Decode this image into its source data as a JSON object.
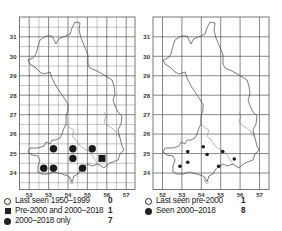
{
  "maps": [
    {
      "id": "left",
      "grid": "tetrad",
      "y_labels": [
        "31",
        "30",
        "29",
        "28",
        "27",
        "26",
        "25",
        "24"
      ],
      "x_labels": [
        "52",
        "53",
        "54",
        "55",
        "56",
        "57"
      ],
      "legend": [
        {
          "symbol": "open-circle-icon",
          "label": "Last seen 1950–1999",
          "count": "0"
        },
        {
          "symbol": "filled-square-icon",
          "label": "Pre-2000 and 2000–2018",
          "count": "1"
        },
        {
          "symbol": "filled-circle-icon",
          "label": "2000–2018 only",
          "count": "7"
        }
      ],
      "records": [
        {
          "type": "dot",
          "x": 53.25,
          "y": 25.25
        },
        {
          "type": "dot",
          "x": 54.25,
          "y": 25.25
        },
        {
          "type": "dot",
          "x": 55.25,
          "y": 25.25
        },
        {
          "type": "dot",
          "x": 54.25,
          "y": 24.75
        },
        {
          "type": "dot",
          "x": 52.75,
          "y": 24.25
        },
        {
          "type": "dot",
          "x": 53.25,
          "y": 24.25
        },
        {
          "type": "dot",
          "x": 54.75,
          "y": 24.25
        },
        {
          "type": "square",
          "x": 55.75,
          "y": 24.75
        }
      ]
    },
    {
      "id": "right",
      "grid": "hectad",
      "y_labels": [
        "31",
        "30",
        "29",
        "28",
        "27",
        "26",
        "25",
        "24"
      ],
      "x_labels": [
        "52",
        "53",
        "54",
        "55",
        "56",
        "57"
      ],
      "legend": [
        {
          "symbol": "open-circle-icon",
          "label": "Last seen pre-2000",
          "count": "1"
        },
        {
          "symbol": "filled-circle-icon",
          "label": "Seen 2000–2018",
          "count": "8"
        }
      ],
      "records": [
        {
          "type": "smalldot",
          "x": 53.3,
          "y": 25.1
        },
        {
          "type": "smalldot",
          "x": 54.1,
          "y": 25.35
        },
        {
          "type": "smalldot",
          "x": 54.3,
          "y": 24.95
        },
        {
          "type": "smalldot",
          "x": 55.1,
          "y": 25.1
        },
        {
          "type": "smalldot",
          "x": 55.7,
          "y": 24.72
        },
        {
          "type": "smalldot",
          "x": 52.9,
          "y": 24.35
        },
        {
          "type": "smalldot",
          "x": 53.3,
          "y": 24.55
        },
        {
          "type": "smalldot",
          "x": 54.9,
          "y": 24.35
        }
      ]
    }
  ],
  "chart_data": [
    {
      "type": "scatter",
      "title": "Distribution map (tetrad)",
      "xlabel": "",
      "ylabel": "",
      "x_ticks": [
        52,
        53,
        54,
        55,
        56,
        57
      ],
      "y_ticks": [
        24,
        25,
        26,
        27,
        28,
        29,
        30,
        31
      ],
      "grid": true,
      "legend": [
        "Last seen 1950–1999: 0",
        "Pre-2000 and 2000–2018: 1",
        "2000–2018 only: 7"
      ],
      "series": [
        {
          "name": "2000–2018 only",
          "marker": "filled-circle",
          "points": [
            [
              53.25,
              25.25
            ],
            [
              54.25,
              25.25
            ],
            [
              55.25,
              25.25
            ],
            [
              54.25,
              24.75
            ],
            [
              52.75,
              24.25
            ],
            [
              53.25,
              24.25
            ],
            [
              54.75,
              24.25
            ]
          ]
        },
        {
          "name": "Pre-2000 and 2000–2018",
          "marker": "filled-square",
          "points": [
            [
              55.75,
              24.75
            ]
          ]
        },
        {
          "name": "Last seen 1950–1999",
          "marker": "open-circle",
          "points": []
        }
      ]
    },
    {
      "type": "scatter",
      "title": "Distribution map (hectad)",
      "xlabel": "",
      "ylabel": "",
      "x_ticks": [
        52,
        53,
        54,
        55,
        56,
        57
      ],
      "y_ticks": [
        24,
        25,
        26,
        27,
        28,
        29,
        30,
        31
      ],
      "grid": true,
      "legend": [
        "Last seen pre-2000: 1",
        "Seen 2000–2018: 8"
      ],
      "series": [
        {
          "name": "Seen 2000–2018",
          "marker": "filled-circle",
          "points": [
            [
              53.3,
              25.1
            ],
            [
              54.1,
              25.35
            ],
            [
              54.3,
              24.95
            ],
            [
              55.1,
              25.1
            ],
            [
              55.7,
              24.72
            ],
            [
              52.9,
              24.35
            ],
            [
              53.3,
              24.55
            ],
            [
              54.9,
              24.35
            ]
          ]
        },
        {
          "name": "Last seen pre-2000",
          "marker": "open-circle",
          "points": []
        }
      ]
    }
  ]
}
